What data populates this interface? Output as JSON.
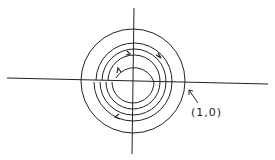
{
  "diagram": {
    "type": "phase-portrait",
    "axes": {
      "horizontal": "x-axis",
      "vertical": "y-axis"
    },
    "annotation": {
      "text": "(1,0)"
    },
    "stroke_color": "#222222"
  }
}
